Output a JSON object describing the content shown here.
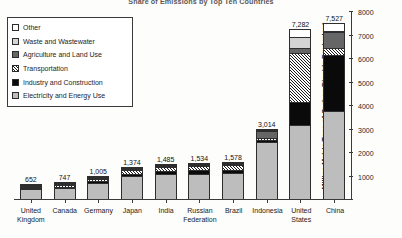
{
  "chart_data": {
    "type": "bar",
    "subtype": "stacked-column",
    "title": "Share of Emissions by Top Ten Countries",
    "xlabel": "",
    "ylabel": "Million Metric Tons of Carbon Dioxide Equivalent",
    "ylim": [
      0,
      8000
    ],
    "yticks": [
      0,
      1000,
      2000,
      3000,
      4000,
      5000,
      6000,
      7000,
      8000
    ],
    "ytick_labels": [
      "",
      "1000",
      "2000",
      "3000",
      "4000",
      "5000",
      "6000",
      "7000",
      "8000"
    ],
    "grid": false,
    "legend_position": "upper-left",
    "axis_side": "right",
    "categories": [
      "United Kingdom",
      "Canada",
      "Germany",
      "Japan",
      "India",
      "Russian Federation",
      "Brazil",
      "Indonesia",
      "United States",
      "China"
    ],
    "totals": [
      652,
      747,
      1005,
      1374,
      1485,
      1534,
      1578,
      3014,
      7282,
      7527
    ],
    "total_labels": [
      "652",
      "747",
      "1,005",
      "1,374",
      "1,485",
      "1,534",
      "1,578",
      "3,014",
      "7,282",
      "7,527"
    ],
    "series": [
      {
        "name": "Electricity and Energy Use",
        "swatch": "light-gray",
        "values": [
          470,
          520,
          740,
          1010,
          1090,
          1120,
          1140,
          2430,
          3150,
          3760
        ]
      },
      {
        "name": "Industry and Construction",
        "swatch": "black",
        "values": [
          40,
          50,
          70,
          120,
          140,
          170,
          150,
          110,
          990,
          2390
        ]
      },
      {
        "name": "Transportation",
        "swatch": "diagonal-hatch",
        "values": [
          85,
          120,
          125,
          175,
          180,
          175,
          200,
          80,
          2120,
          300
        ]
      },
      {
        "name": "Agriculture and Land Use",
        "swatch": "dark-gray",
        "values": [
          20,
          25,
          30,
          25,
          40,
          30,
          45,
          330,
          190,
          700
        ]
      },
      {
        "name": "Waste and Wastewater",
        "swatch": "medium-light-gray",
        "values": [
          22,
          17,
          20,
          22,
          20,
          22,
          23,
          34,
          460,
          55
        ]
      },
      {
        "name": "Other",
        "swatch": "white",
        "values": [
          15,
          15,
          20,
          22,
          15,
          17,
          20,
          30,
          372,
          322
        ]
      }
    ]
  },
  "legend": {
    "items": [
      {
        "label": "Other",
        "swatch": "white"
      },
      {
        "label": "Waste and Wastewater",
        "swatch": "light-gray"
      },
      {
        "label": "Agriculture and Land Use",
        "swatch": "dark-gray"
      },
      {
        "label": "Transportation",
        "swatch": "diagonal-hatch"
      },
      {
        "label": "Industry and Construction",
        "swatch": "black"
      },
      {
        "label": "Electricity and Energy Use",
        "swatch": "medium-gray"
      }
    ]
  },
  "colors": {
    "other": "#ffffff",
    "waste": "#d4d4d4",
    "agriculture": "#666666",
    "transportation": "#ffffff",
    "industry": "#0a0a0a",
    "electricity": "#bdbdbd",
    "axis": "#3a3a3a",
    "background": "#fdfdfb"
  }
}
